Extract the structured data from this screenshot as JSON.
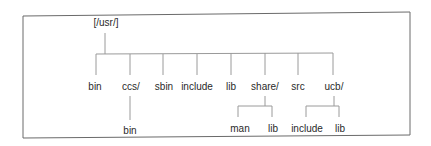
{
  "diagram": {
    "type": "directory-tree",
    "root": {
      "label": "[/usr/]"
    },
    "children": [
      {
        "label": "bin",
        "children": []
      },
      {
        "label": "ccs/",
        "children": [
          {
            "label": "bin"
          }
        ]
      },
      {
        "label": "sbin",
        "children": []
      },
      {
        "label": "include",
        "children": []
      },
      {
        "label": "lib",
        "children": []
      },
      {
        "label": "share/",
        "children": [
          {
            "label": "man"
          },
          {
            "label": "lib"
          }
        ]
      },
      {
        "label": "src",
        "children": []
      },
      {
        "label": "ucb/",
        "children": [
          {
            "label": "include"
          },
          {
            "label": "lib"
          }
        ]
      }
    ],
    "colors": {
      "line": "#9a9a9a",
      "frame": "#6a6a6a",
      "text": "#2a2a2a",
      "background": "#ffffff"
    }
  }
}
